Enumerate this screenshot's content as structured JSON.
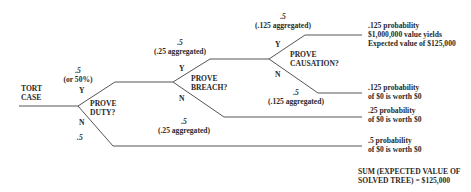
{
  "root": {
    "label_line1": "TORT",
    "label_line2": "CASE"
  },
  "nodes": {
    "duty": {
      "line1": "PROVE",
      "line2": "DUTY?",
      "yes_prob": ".5",
      "yes_note": "(or 50%)",
      "yes": "Y",
      "no": "N",
      "no_prob": ".5"
    },
    "breach": {
      "line1": "PROVE",
      "line2": "BREACH?",
      "yes_prob": ".5",
      "yes_note": "(.25 aggregated)",
      "yes": "Y",
      "no": "N",
      "no_prob": ".5",
      "no_note": "(.25 aggregated)"
    },
    "causation": {
      "line1": "PROVE",
      "line2": "CAUSATION?",
      "yes_prob": ".5",
      "yes_note": "(.125 aggregated)",
      "yes": "Y",
      "no": "N",
      "no_prob": ".5",
      "no_note": "(.125 aggregated)"
    }
  },
  "outcomes": [
    {
      "line1": ".125 probability",
      "line2": "$1,000,000 value yields",
      "line3": "Expected value of $125,000"
    },
    {
      "line1": ".125 probability",
      "line2": "of $0 is worth $0"
    },
    {
      "line1": ".25 probability",
      "line2": "of $0 is worth $0"
    },
    {
      "line1": ".5 probability",
      "line2": "of $0 is worth $0"
    }
  ],
  "summary": {
    "line1": "SUM (EXPECTED VALUE OF",
    "line2": "SOLVED TREE) = $125,000"
  },
  "colors": {
    "line": "#555555",
    "text": "#2a2a2a"
  }
}
